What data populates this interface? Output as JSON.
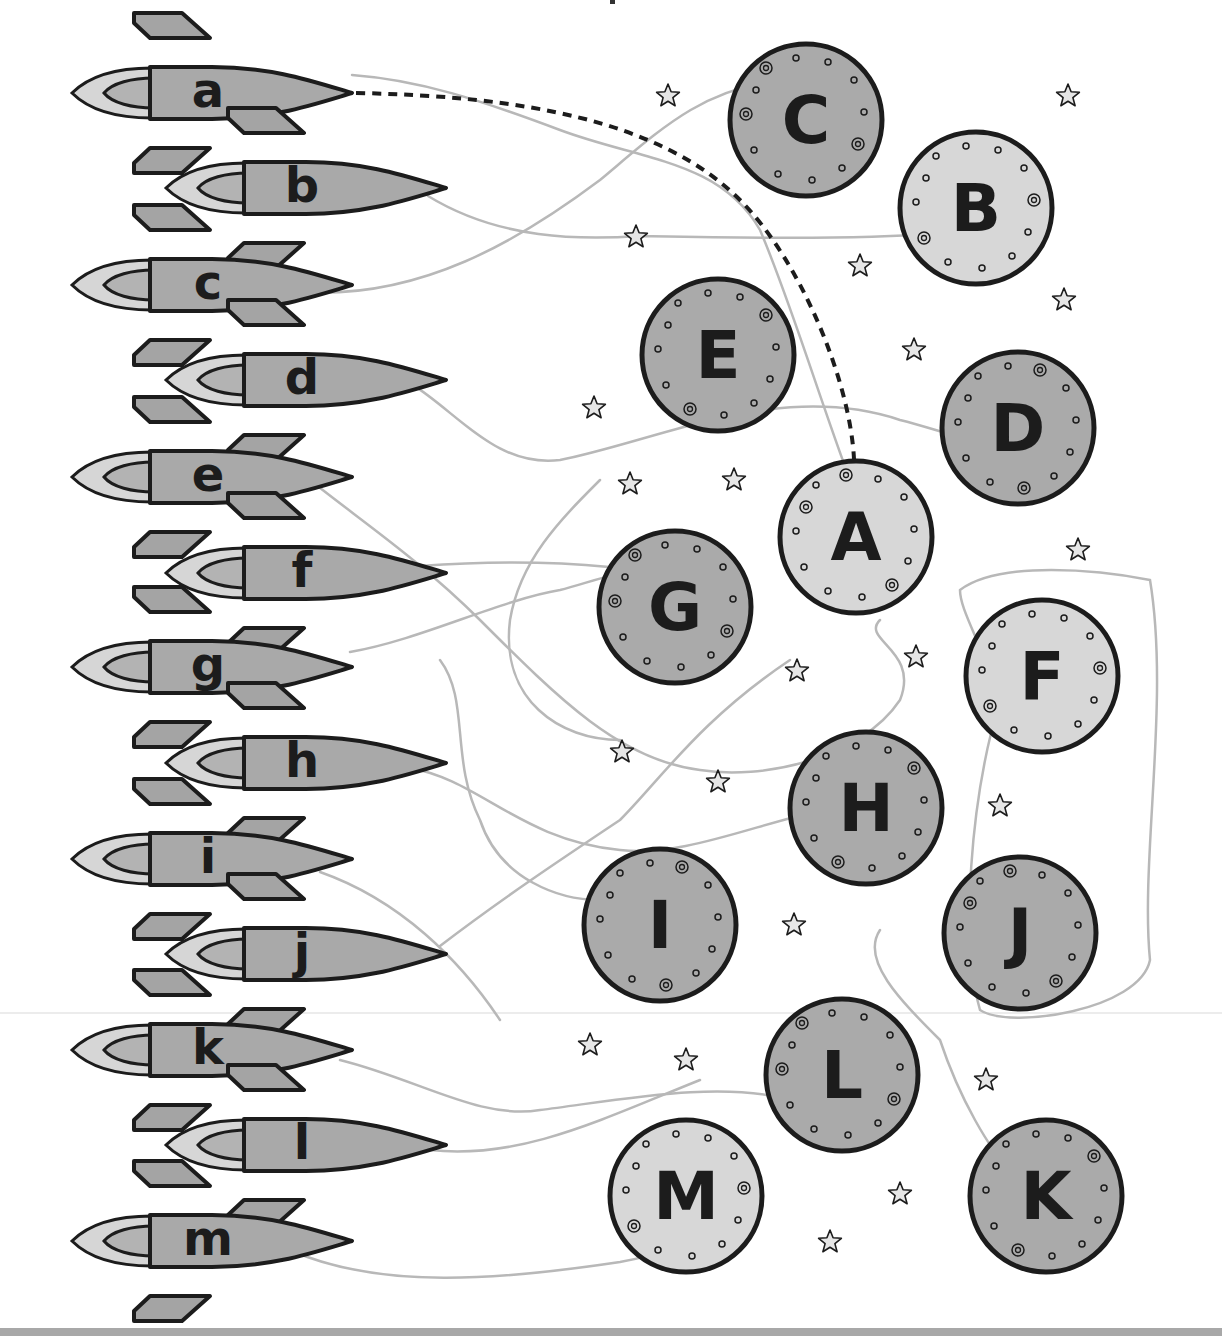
{
  "worksheet": {
    "activity": "match lowercase rocket letters to uppercase planet letters",
    "colors": {
      "outline": "#1c1c1c",
      "rocket_body": "#a9a9a9",
      "rocket_fin": "#a4a4a4",
      "rocket_flame_outer": "#d6d6d6",
      "rocket_flame_inner": "#b3b3b3",
      "planet_dark": "#aaaaaa",
      "planet_light": "#d7d7d7",
      "star_fill": "#e6e6e6",
      "pencil_line": "#b8b8b8",
      "dashed_example": "#1c1c1c",
      "bottom_rule": "#a8a8a8"
    },
    "rockets": [
      {
        "letter": "a",
        "x": 72,
        "y": 93
      },
      {
        "letter": "b",
        "x": 166,
        "y": 188
      },
      {
        "letter": "c",
        "x": 72,
        "y": 285
      },
      {
        "letter": "d",
        "x": 166,
        "y": 380
      },
      {
        "letter": "e",
        "x": 72,
        "y": 477
      },
      {
        "letter": "f",
        "x": 166,
        "y": 573
      },
      {
        "letter": "g",
        "x": 72,
        "y": 667
      },
      {
        "letter": "h",
        "x": 166,
        "y": 763
      },
      {
        "letter": "i",
        "x": 72,
        "y": 859
      },
      {
        "letter": "j",
        "x": 166,
        "y": 954
      },
      {
        "letter": "k",
        "x": 72,
        "y": 1050
      },
      {
        "letter": "l",
        "x": 166,
        "y": 1145
      },
      {
        "letter": "m",
        "x": 72,
        "y": 1241
      }
    ],
    "planets": [
      {
        "letter": "C",
        "cx": 806,
        "cy": 120,
        "shade": "dark"
      },
      {
        "letter": "B",
        "cx": 976,
        "cy": 208,
        "shade": "light"
      },
      {
        "letter": "E",
        "cx": 718,
        "cy": 355,
        "shade": "dark"
      },
      {
        "letter": "D",
        "cx": 1018,
        "cy": 428,
        "shade": "dark"
      },
      {
        "letter": "A",
        "cx": 856,
        "cy": 537,
        "shade": "light"
      },
      {
        "letter": "G",
        "cx": 675,
        "cy": 607,
        "shade": "dark"
      },
      {
        "letter": "F",
        "cx": 1042,
        "cy": 676,
        "shade": "light"
      },
      {
        "letter": "H",
        "cx": 866,
        "cy": 808,
        "shade": "dark"
      },
      {
        "letter": "I",
        "cx": 660,
        "cy": 925,
        "shade": "dark"
      },
      {
        "letter": "J",
        "cx": 1020,
        "cy": 933,
        "shade": "dark"
      },
      {
        "letter": "L",
        "cx": 842,
        "cy": 1075,
        "shade": "dark"
      },
      {
        "letter": "M",
        "cx": 686,
        "cy": 1196,
        "shade": "light"
      },
      {
        "letter": "K",
        "cx": 1046,
        "cy": 1196,
        "shade": "dark"
      }
    ],
    "stars": [
      [
        668,
        96
      ],
      [
        1068,
        96
      ],
      [
        636,
        237
      ],
      [
        860,
        266
      ],
      [
        1064,
        300
      ],
      [
        914,
        350
      ],
      [
        594,
        408
      ],
      [
        630,
        484
      ],
      [
        734,
        480
      ],
      [
        1078,
        550
      ],
      [
        916,
        657
      ],
      [
        797,
        671
      ],
      [
        622,
        752
      ],
      [
        718,
        782
      ],
      [
        1000,
        806
      ],
      [
        794,
        925
      ],
      [
        590,
        1045
      ],
      [
        686,
        1060
      ],
      [
        986,
        1080
      ],
      [
        900,
        1194
      ],
      [
        830,
        1242
      ]
    ],
    "example_match": {
      "from": "a",
      "to": "A"
    },
    "pencil_lines": [
      "M352,75 C420,80 480,100 560,130 C640,160 720,160 760,230 C790,300 820,400 850,480",
      "M428,196 C500,240 580,240 640,236 C760,238 860,240 960,232",
      "M300,292 C420,300 520,240 600,180 C660,130 700,90 780,80",
      "M372,368 C440,380 480,470 560,460 C660,440 780,380 900,420 C940,430 960,440 1000,444",
      "M310,480 C360,520 420,560 480,620 C560,700 620,760 700,770 C760,780 860,760 900,700 C920,650 860,640 880,620",
      "M420,566 C500,560 600,560 700,580",
      "M350,652 C420,640 500,600 560,590 C600,580 640,560 700,572",
      "M410,768 C480,780 520,840 620,850 C700,860 800,800 900,800",
      "M320,872 C400,900 460,960 500,1020",
      "M440,946 C500,900 560,860 620,820 C660,780 700,720 790,660",
      "M340,1060 C420,1080 480,1120 540,1110 C620,1100 720,1080 790,1100",
      "M430,1150 C520,1160 600,1120 700,1080",
      "M290,1250 C380,1290 500,1280 620,1262 C660,1255 700,1240 750,1220",
      "M960,590 C1000,560 1100,570 1150,580 C1170,700 1140,860 1150,960 C1140,1010 1010,1030 980,1010 C960,940 970,800 1000,700 C980,640 960,610 960,590",
      "M880,930 C860,960 900,1000 940,1040 C960,1100 990,1150 1010,1170",
      "M440,660 C470,700 450,760 480,820 C500,880 560,900 600,900",
      "M600,480 C560,520 520,560 510,620 C500,700 560,740 620,740"
    ]
  }
}
